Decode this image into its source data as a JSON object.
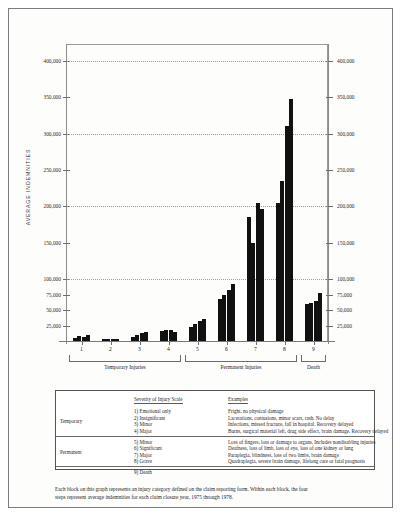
{
  "chart_data": {
    "type": "bar",
    "title": "",
    "xlabel": "",
    "ylabel": "AVERAGE INDEMNITIES",
    "ylim": [
      0,
      400000
    ],
    "grid": true,
    "grid_values": [
      100000,
      200000,
      300000,
      400000
    ],
    "ytick_labels": [
      "25,000",
      "50,000",
      "75,000",
      "100,000",
      "150,000",
      "200,000",
      "250,000",
      "300,000",
      "350,000",
      "400,000"
    ],
    "ytick_values": [
      25000,
      50000,
      75000,
      100000,
      150000,
      200000,
      250000,
      300000,
      350000,
      400000
    ],
    "categories": [
      "1",
      "2",
      "3",
      "4",
      "5",
      "6",
      "7",
      "8",
      "9"
    ],
    "series_note": "Within each block, the four steps represent average indemnities for each claim closure year, 1975 through 1978",
    "series": [
      {
        "name": "1975",
        "values": [
          5000,
          2500,
          7000,
          16000,
          22000,
          68000,
          185000,
          205000,
          60000
        ]
      },
      {
        "name": "1976",
        "values": [
          7500,
          3000,
          9000,
          17000,
          28000,
          75000,
          150000,
          235000,
          62000
        ]
      },
      {
        "name": "1977",
        "values": [
          7000,
          3500,
          13000,
          17500,
          32000,
          82000,
          205000,
          310000,
          65000
        ]
      },
      {
        "name": "1978",
        "values": [
          9000,
          3500,
          14000,
          14500,
          35000,
          92000,
          196000,
          348000,
          78000
        ]
      }
    ],
    "group_brackets": [
      {
        "label": "Temporary Injuries",
        "from": "1",
        "to": "4"
      },
      {
        "label": "Permanent Injuries",
        "from": "5",
        "to": "8"
      },
      {
        "label": "Death",
        "from": "9",
        "to": "9"
      }
    ],
    "bar_color": "#111111",
    "axis_color": "#8c8c8c"
  },
  "legend": {
    "columns": {
      "scale_header": "Severity of Injury Scale",
      "examples_header": "Examples"
    },
    "groups": [
      {
        "group_label": "Temporary",
        "rows": [
          {
            "scale": "1) Emotional only",
            "example": "Fright, no physical damage"
          },
          {
            "scale": "2) Insignificant",
            "example": "Lacerations, contusions, minor scars, rash. No delay"
          },
          {
            "scale": "3) Minor",
            "example": "Infections, missed fracture, fall in hospital. Recovery delayed"
          },
          {
            "scale": "4) Major",
            "example": "Burns, surgical material left, drug side effect, brain damage. Recovery delayed"
          }
        ]
      },
      {
        "group_label": "Permanent",
        "rows": [
          {
            "scale": "5) Minor",
            "example": "Loss of fingers, loss or damage to organs. Includes nondisabling injuries"
          },
          {
            "scale": "6) Significant",
            "example": "Deafness, loss of limb, loss of eye, loss of one kidney or lung"
          },
          {
            "scale": "7) Major",
            "example": "Paraplegia, blindness, loss of two limbs, brain damage"
          },
          {
            "scale": "8) Grave",
            "example": "Quadraplegia, severe brain damage, lifelong care or fatal prognosis"
          }
        ]
      },
      {
        "group_label": "",
        "rows": [
          {
            "scale": "9) Death",
            "example": ""
          }
        ]
      }
    ]
  },
  "caption": {
    "line1": "Each block on this graph represents an injury category defined on the claim reporting form. Within each block, the four",
    "line2": "steps represent average indemnities for each claim closure year, 1975 through 1978."
  }
}
